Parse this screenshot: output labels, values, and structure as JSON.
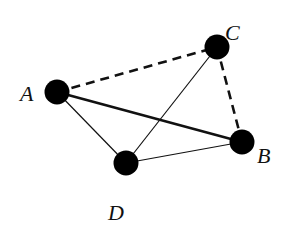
{
  "diagram": {
    "type": "graph",
    "nodes": [
      {
        "id": "A",
        "label": "A",
        "x": 57,
        "y": 92,
        "label_x": 20,
        "label_y": 101
      },
      {
        "id": "B",
        "label": "B",
        "x": 242,
        "y": 142,
        "label_x": 257,
        "label_y": 163
      },
      {
        "id": "C",
        "label": "C",
        "x": 217,
        "y": 47,
        "label_x": 225,
        "label_y": 40
      },
      {
        "id": "D",
        "label": "D",
        "x": 126,
        "y": 163,
        "label_x": 108,
        "label_y": 220
      }
    ],
    "edges": [
      {
        "from": "A",
        "to": "C",
        "style": "dashed",
        "weight": "thick"
      },
      {
        "from": "C",
        "to": "B",
        "style": "dashed",
        "weight": "thick"
      },
      {
        "from": "A",
        "to": "B",
        "style": "solid",
        "weight": "thick"
      },
      {
        "from": "A",
        "to": "D",
        "style": "solid",
        "weight": "thin"
      },
      {
        "from": "D",
        "to": "C",
        "style": "solid",
        "weight": "thin"
      },
      {
        "from": "D",
        "to": "B",
        "style": "solid",
        "weight": "thin"
      }
    ],
    "colors": {
      "node": "#000000",
      "edge": "#111111",
      "background": "#ffffff"
    }
  }
}
